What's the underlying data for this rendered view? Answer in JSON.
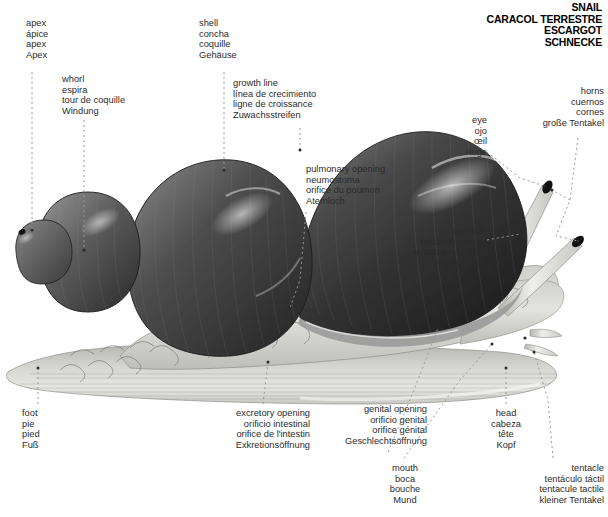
{
  "title": {
    "lines": [
      "SNAIL",
      "CARACOL TERRESTRE",
      "ESCARGOT",
      "SCHNECKE"
    ]
  },
  "labels": {
    "apex": {
      "en": "apex",
      "es": "ápice",
      "fr": "apex",
      "de": "Apex"
    },
    "whorl": {
      "en": "whorl",
      "es": "espira",
      "fr": "tour de coquille",
      "de": "Windung"
    },
    "shell": {
      "en": "shell",
      "es": "concha",
      "fr": "coquille",
      "de": "Gehäuse"
    },
    "growth": {
      "en": "growth line",
      "es": "línea de crecimiento",
      "fr": "ligne de croissance",
      "de": "Zuwachsstreifen"
    },
    "pulmonary": {
      "en": "pulmonary opening",
      "es": "neumostoma",
      "fr": "orifice du poumon",
      "de": "Atemloch"
    },
    "eye": {
      "en": "eye",
      "es": "ojo",
      "fr": "œil",
      "de": "Auge"
    },
    "horns": {
      "en": "horns",
      "es": "cuernos",
      "fr": "cornes",
      "de": "große Tentakel"
    },
    "eyestalk": {
      "en": "eyestalk",
      "es": "tentáculo ocular",
      "fr": "tentacule oculaire",
      "de": "Augenträger"
    },
    "foot": {
      "en": "foot",
      "es": "pie",
      "fr": "pied",
      "de": "Fuß"
    },
    "excretory": {
      "en": "excretory opening",
      "es": "orificio intestinal",
      "fr": "orifice de l'intestin",
      "de": "Exkretionsöffnung"
    },
    "genital": {
      "en": "genital opening",
      "es": "orificio genital",
      "fr": "orifice génital",
      "de": "Geschlechtsöffnung"
    },
    "head": {
      "en": "head",
      "es": "cabeza",
      "fr": "tête",
      "de": "Kopf"
    },
    "mouth": {
      "en": "mouth",
      "es": "boca",
      "fr": "bouche",
      "de": "Mund"
    },
    "tentacle": {
      "en": "tentacle",
      "es": "tentáculo táctil",
      "fr": "tentacule tactile",
      "de": "kleiner Tentakel"
    }
  },
  "colors": {
    "background": "#ffffff",
    "text": "#2b2b2b",
    "title": "#000000",
    "leader": "#9a9a9a",
    "shell_dark": "#3a3a3a",
    "shell_mid": "#575757",
    "shell_light": "#8d8d8d",
    "body_light": "#dcdcda",
    "body_mid": "#b9b9b6",
    "outline": "#6b6b6b"
  }
}
